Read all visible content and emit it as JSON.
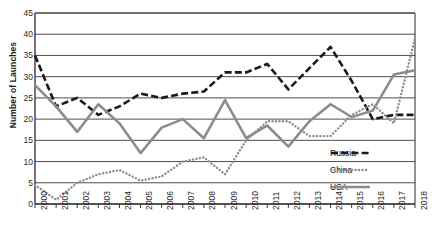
{
  "chart_data": {
    "type": "line",
    "title": "",
    "xlabel": "",
    "ylabel": "Number of Launches",
    "categories": [
      "2000",
      "2001",
      "2002",
      "2003",
      "2004",
      "2005",
      "2006",
      "2007",
      "2008",
      "2009",
      "2010",
      "2011",
      "2012",
      "2013",
      "2014",
      "2015",
      "2016",
      "2017",
      "2018"
    ],
    "x": [
      2000,
      2001,
      2002,
      2003,
      2004,
      2005,
      2006,
      2007,
      2008,
      2009,
      2010,
      2011,
      2012,
      2013,
      2014,
      2015,
      2016,
      2017,
      2018
    ],
    "ylim": [
      0,
      45
    ],
    "ytick_step": 5,
    "yticks": [
      "45",
      "40",
      "35",
      "30",
      "25",
      "20",
      "15",
      "10",
      "5",
      "0"
    ],
    "grid": "horizontal",
    "legend_position": "inside-bottom-right",
    "series": [
      {
        "name": "Russia",
        "style": "dashed",
        "color": "#1a1a1a",
        "values": [
          35,
          23,
          25,
          21,
          23,
          26,
          25,
          26,
          26.5,
          31,
          31,
          33,
          27,
          32,
          37,
          29,
          20,
          21,
          21
        ]
      },
      {
        "name": "China",
        "style": "dotted",
        "color": "#8c8c8c",
        "values": [
          4.5,
          1,
          5,
          7,
          8,
          5.5,
          6.5,
          10,
          11,
          7,
          15,
          19.5,
          19.5,
          16,
          16,
          21,
          23.5,
          19,
          39
        ]
      },
      {
        "name": "USA",
        "style": "solid",
        "color": "#8c8c8c",
        "values": [
          28,
          23,
          17,
          23.5,
          19,
          12,
          18,
          20,
          15.5,
          24.5,
          15.5,
          18.5,
          13.5,
          19.5,
          23.5,
          20.5,
          22,
          30.5,
          31.5
        ]
      }
    ]
  },
  "legend": {
    "items": [
      {
        "label": "Russia"
      },
      {
        "label": "China"
      },
      {
        "label": "USA"
      }
    ]
  },
  "colors": {
    "axis": "#3a3a3a",
    "grid": "#3a3a3a",
    "russia": "#1a1a1a",
    "china": "#8c8c8c",
    "usa": "#8c8c8c",
    "background": "#ffffff"
  }
}
